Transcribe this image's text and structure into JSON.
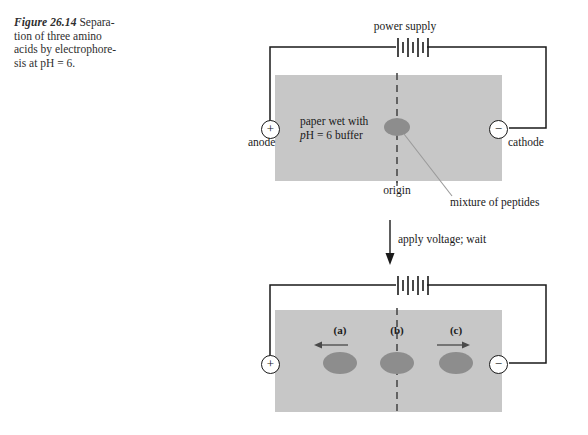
{
  "figure": {
    "number": "Figure 26.14",
    "caption": "Separation of three amino acids by electrophoresis at pH = 6.",
    "caption_line1": "Separa-",
    "caption_line2": "tion of three amino",
    "caption_line3": "acids by electrophore-",
    "caption_line4": "sis at pH = 6."
  },
  "colors": {
    "paper_fill": "#c7c7c7",
    "spot_fill": "#8d8d8d",
    "line": "#1a1a1a",
    "leader_line": "#8a8a8a",
    "background": "#ffffff"
  },
  "top_apparatus": {
    "power_supply_label": "power supply",
    "anode_label": "anode",
    "anode_sign": "+",
    "cathode_label": "cathode",
    "cathode_sign": "−",
    "paper_label_line1_pre": "",
    "paper_label_line1": "paper wet with",
    "paper_label_line2_italic": "p",
    "paper_label_line2_rest": "H = 6 buffer",
    "origin_label": "origin",
    "mixture_label": "mixture of peptides",
    "battery_cells": 4
  },
  "transition": {
    "arrow_label": "apply voltage; wait",
    "direction": "down"
  },
  "bottom_apparatus": {
    "anode_sign": "+",
    "cathode_sign": "−",
    "battery_cells": 4,
    "spots": [
      {
        "label": "(a)",
        "migration": "toward anode (left)",
        "arrow": "left-arrow-icon",
        "x": 340
      },
      {
        "label": "(b)",
        "migration": "none (stays at origin)",
        "arrow": "none",
        "x": 397
      },
      {
        "label": "(c)",
        "migration": "toward cathode (right)",
        "arrow": "right-arrow-icon",
        "x": 456
      }
    ]
  }
}
